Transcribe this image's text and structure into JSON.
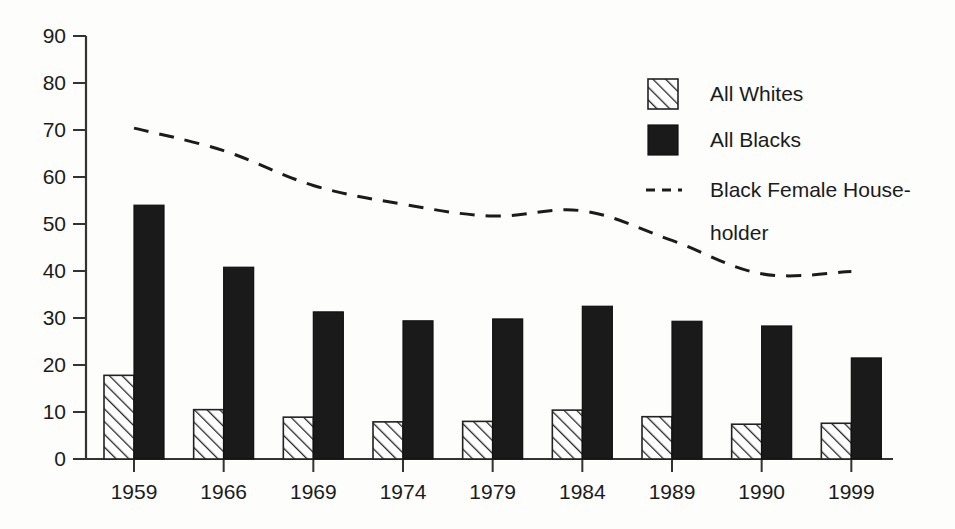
{
  "chart_data": {
    "type": "bar",
    "title": "",
    "subtitle": "",
    "xlabel": "",
    "ylabel": "",
    "categories": [
      "1959",
      "1966",
      "1969",
      "1974",
      "1979",
      "1984",
      "1989",
      "1990",
      "1999"
    ],
    "ylim": [
      0,
      90
    ],
    "yticks": [
      0,
      10,
      20,
      30,
      40,
      50,
      60,
      70,
      80,
      90
    ],
    "ytick_labels": [
      "0",
      "10",
      "20",
      "30",
      "40",
      "50",
      "60",
      "70",
      "80",
      "90"
    ],
    "grid": false,
    "legend_position": "top-right",
    "series": [
      {
        "name": "All Whites",
        "type": "bar",
        "style": "hatched",
        "values": [
          17.8,
          10.5,
          8.9,
          7.9,
          8.0,
          10.4,
          9.0,
          7.4,
          7.6
        ]
      },
      {
        "name": "All Blacks",
        "type": "bar",
        "style": "solid-black",
        "values": [
          54.0,
          40.8,
          31.3,
          29.4,
          29.8,
          32.5,
          29.3,
          28.3,
          21.5
        ]
      },
      {
        "name": "Black Female House-\nholder",
        "type": "line",
        "style": "dashed",
        "values": [
          70.4,
          65.6,
          58.2,
          54.2,
          51.7,
          52.8,
          46.5,
          39.4,
          39.9
        ]
      }
    ]
  },
  "legend": {
    "entries": [
      {
        "label": "All Whites",
        "marker": "hatched-swatch"
      },
      {
        "label": "All Blacks",
        "marker": "solid-swatch"
      },
      {
        "label": "Black Female House-",
        "marker": "dashed-line"
      },
      {
        "label": "holder",
        "marker": "none"
      }
    ]
  },
  "colors": {
    "background": "#fdfdfb",
    "ink": "#1b1b1b",
    "axis": "#333333",
    "bar_black": "#1a1a1a",
    "bar_white_fill": "#ffffff"
  }
}
